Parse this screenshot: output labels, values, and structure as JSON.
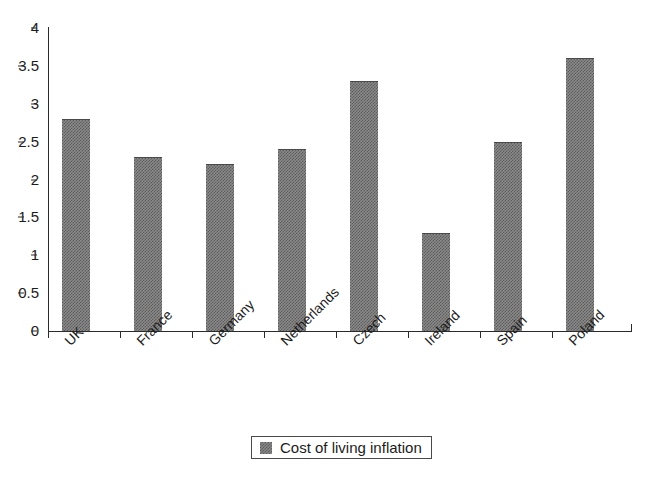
{
  "chart_data": {
    "type": "bar",
    "title": "",
    "subtitle": "",
    "xlabel": "",
    "ylabel": "",
    "categories": [
      "UK",
      "France",
      "Germany",
      "Netherlands",
      "Czech",
      "Ireland",
      "Spain",
      "Poland"
    ],
    "values": [
      2.8,
      2.3,
      2.2,
      2.4,
      3.3,
      1.3,
      2.5,
      3.6
    ],
    "series": [
      {
        "name": "Cost of living inflation",
        "values": [
          2.8,
          2.3,
          2.2,
          2.4,
          3.3,
          1.3,
          2.5,
          3.6
        ]
      }
    ],
    "ylim": [
      0,
      4
    ],
    "ytick_labels": [
      "0",
      "0.5",
      "1",
      "1.5",
      "2",
      "2.5",
      "3",
      "3.5",
      "4"
    ],
    "ytick_values": [
      0,
      0.5,
      1,
      1.5,
      2,
      2.5,
      3,
      3.5,
      4
    ],
    "grid": false,
    "legend_position": "bottom",
    "legend_entries": [
      "Cost of living inflation"
    ],
    "bar_color": "#8a8a8a",
    "bar_edge_color": "#4a4a4a",
    "axis_color": "#2b2b2b",
    "background_color": "#ffffff",
    "xlabel_rotation": -45,
    "annotations": []
  },
  "legend": {
    "entry_label": "Cost of living inflation"
  }
}
